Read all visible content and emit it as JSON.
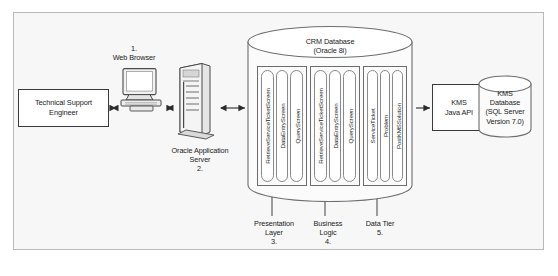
{
  "diagram": {
    "caption": "",
    "frame_color": "#b9b9b9",
    "background_color": "#f7f7f7",
    "actor": {
      "label": "Technical Support\nEngineer"
    },
    "client": {
      "step": "1.",
      "label": "1.\nWeb Browser",
      "icon": "desktop-computer-icon"
    },
    "app_server": {
      "step": "2.",
      "label": "Oracle Application\nServer\n2.",
      "icon": "server-tower-icon"
    },
    "crm_database": {
      "title": "CRM Database\n(Oracle 8i)",
      "icon": "database-cylinder-icon",
      "groups": [
        {
          "name": "presentation-tier-group",
          "items": [
            "RetrieveServiceTicketScreen",
            "DataEntryScreen",
            "QueryScreen"
          ]
        },
        {
          "name": "business-tier-group",
          "items": [
            "RetrieveServiceTicketScreen",
            "DataEntryScreen",
            "QueryScreen"
          ]
        },
        {
          "name": "data-tier-group",
          "items": [
            "ServiceTicket",
            "Problem",
            "PostKMSSolution"
          ]
        }
      ]
    },
    "kms_api": {
      "label": "KMS\nJava API"
    },
    "kms_database": {
      "label": "KMS\nDatabase\n(SQL Server\nVersion 7.0)",
      "icon": "database-cylinder-icon"
    },
    "tier_labels": [
      {
        "name": "presentation-layer",
        "label": "Presentation\nLayer\n3."
      },
      {
        "name": "business-logic",
        "label": "Business\nLogic\n4."
      },
      {
        "name": "data-tier",
        "label": "Data Tier\n5."
      }
    ]
  }
}
